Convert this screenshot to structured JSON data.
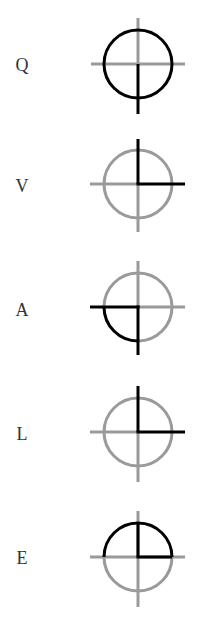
{
  "colors": {
    "background": "#ffffff",
    "highlight": "#000000",
    "base": "#9a9a9a",
    "letter": "#333333"
  },
  "items": [
    {
      "letter": "Q",
      "highlighted_parts": [
        "circle-full",
        "line-down"
      ],
      "description": "full circle with downward stroke"
    },
    {
      "letter": "V",
      "highlighted_parts": [
        "line-up",
        "line-right"
      ],
      "description": "upward and rightward strokes"
    },
    {
      "letter": "A",
      "highlighted_parts": [
        "line-left",
        "line-down",
        "arc-bottom-left"
      ],
      "description": "leftward and downward strokes with bottom-left arc"
    },
    {
      "letter": "L",
      "highlighted_parts": [
        "line-up",
        "line-right"
      ],
      "description": "upward and rightward strokes"
    },
    {
      "letter": "E",
      "highlighted_parts": [
        "arc-top-left",
        "arc-top-right",
        "line-up-inner",
        "line-right-inner"
      ],
      "description": "top semicircle with inner upward and rightward strokes"
    }
  ]
}
